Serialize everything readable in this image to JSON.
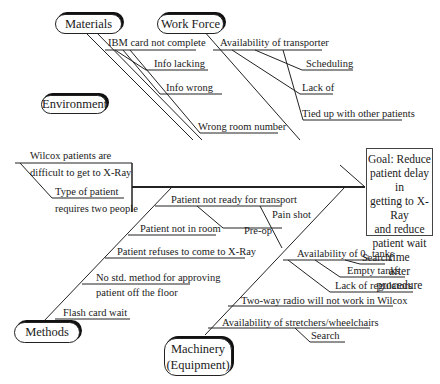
{
  "goal": {
    "lines": [
      "Goal: Reduce",
      "patient delay in",
      "getting to X-Ray",
      "and reduce",
      "patient wait time",
      "after procedure"
    ]
  },
  "categories": {
    "materials": "Materials",
    "work_force": "Work Force",
    "environment": "Environment",
    "methods": "Methods",
    "machinery_line1": "Machinery",
    "machinery_line2": "(Equipment)"
  },
  "materials": {
    "causes": [
      "IBM card not complete",
      "Info lacking",
      "Info wrong",
      "Wrong room number"
    ]
  },
  "work_force": {
    "cause": "Availability of transporter",
    "sub_causes": [
      "Scheduling",
      "Lack of",
      "Tied up with other patients"
    ]
  },
  "environment": {
    "causes": [
      {
        "line1": "Wilcox patients are",
        "line2": "difficult to get to X-Ray"
      },
      {
        "line1": "Type of patient",
        "line2": "requires two people"
      }
    ]
  },
  "methods": {
    "not_ready": "Patient not ready for transport",
    "not_ready_subs": [
      "Pain shot",
      "Pre-op"
    ],
    "causes": [
      "Patient not in room",
      "Patient refuses to come to X-Ray"
    ],
    "no_method": {
      "line1": "No std. method for approving",
      "line2": "patient off the floor"
    },
    "flash": "Flash card wait"
  },
  "machinery": {
    "o2": "Availability of 0₂ tanks",
    "o2_subs": [
      "Search",
      "Empty tanks",
      "Lack of regulators"
    ],
    "radio": "Two-way radio will not work in Wilcox",
    "stretchers": "Availability of stretchers/wheelchairs",
    "stretchers_sub": "Search"
  }
}
